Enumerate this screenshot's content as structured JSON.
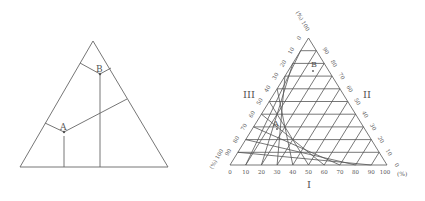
{
  "left_diagram": {
    "points": [
      {
        "label": "A"
      },
      {
        "label": "B"
      }
    ]
  },
  "right_diagram": {
    "axis_labels": {
      "bottom": "I",
      "right": "II",
      "left": "III"
    },
    "percent_unit": "(%)",
    "base_ticks": [
      "0",
      "10",
      "20",
      "30",
      "40",
      "50",
      "60",
      "70",
      "80",
      "90",
      "100"
    ],
    "right_ticks": [
      "0",
      "10",
      "20",
      "30",
      "40",
      "50",
      "60",
      "70",
      "80",
      "90",
      "100"
    ],
    "left_ticks": [
      "0",
      "10",
      "20",
      "30",
      "40",
      "50",
      "60",
      "70",
      "80",
      "90",
      "100"
    ],
    "points": [
      {
        "label": "A"
      },
      {
        "label": "B"
      }
    ],
    "colors": {
      "line": "#555555",
      "text": "#555555"
    }
  }
}
